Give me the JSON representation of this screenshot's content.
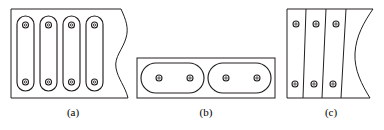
{
  "page": {
    "background_color": "#ffffff",
    "line_color": "#231f20",
    "cut_text_remnant": "— — — — — — — — — — — —"
  },
  "figures": [
    {
      "id": "a",
      "caption": "(a)",
      "name": "four-vertical-slots-plate",
      "outline": "rectangular plate with wavy break line on right edge",
      "slot_shape": "vertical stadium slot",
      "slot_count": 4,
      "holes_per_slot": 2,
      "hole_shape": "small circle",
      "hole_count": 8
    },
    {
      "id": "b",
      "caption": "(b)",
      "name": "two-horizontal-slots-plate",
      "outline": "horizontal rectangular plate",
      "slot_shape": "horizontal stadium slot",
      "slot_count": 2,
      "holes_per_slot": 2,
      "hole_shape": "small circle",
      "hole_count": 4
    },
    {
      "id": "c",
      "caption": "(c)",
      "name": "three-slanted-strips-plate",
      "outline": "rectangular plate with S-curve break line on right edge",
      "slot_shape": "slanted straight strip divider",
      "slot_count": 3,
      "holes_per_slot": 2,
      "hole_shape": "small circle",
      "hole_count": 6
    }
  ]
}
